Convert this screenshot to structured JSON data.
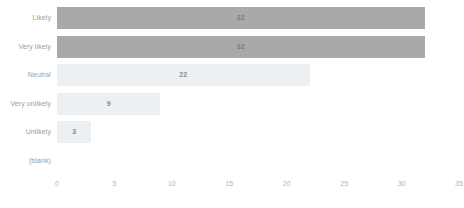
{
  "chart_data": {
    "type": "bar",
    "orientation": "horizontal",
    "title": "",
    "subtitle": "",
    "xlabel": "",
    "ylabel": "",
    "xlim": [
      0,
      35
    ],
    "xticks": [
      "0",
      "5",
      "10",
      "15",
      "20",
      "25",
      "30",
      "35"
    ],
    "grid": false,
    "legend": false,
    "categories": [
      "Likely",
      "Very likely",
      "Neutral",
      "Very unlikely",
      "Unlikely",
      "(blank)"
    ],
    "values": [
      32,
      32,
      22,
      9,
      3,
      0
    ],
    "bars": [
      {
        "category": "Likely",
        "value": 32,
        "label": "32",
        "style": "dark",
        "show_label": true
      },
      {
        "category": "Very likely",
        "value": 32,
        "label": "32",
        "style": "dark",
        "show_label": true
      },
      {
        "category": "Neutral",
        "value": 22,
        "label": "22",
        "style": "light",
        "show_label": true
      },
      {
        "category": "Very unlikely",
        "value": 9,
        "label": "9",
        "style": "light",
        "show_label": true
      },
      {
        "category": "Unlikely",
        "value": 3,
        "label": "3",
        "style": "light",
        "show_label": true
      },
      {
        "category": "(blank)",
        "value": 0,
        "label": "",
        "style": "empty",
        "show_label": false
      }
    ],
    "colors": {
      "bar_dark": "#a9a9a9",
      "bar_light": "#edf0f2",
      "background": "#ffffff",
      "tick_text": "#b4b4b4",
      "category_text": "#9d9d9d",
      "value_text": "#8a8a8a"
    }
  }
}
